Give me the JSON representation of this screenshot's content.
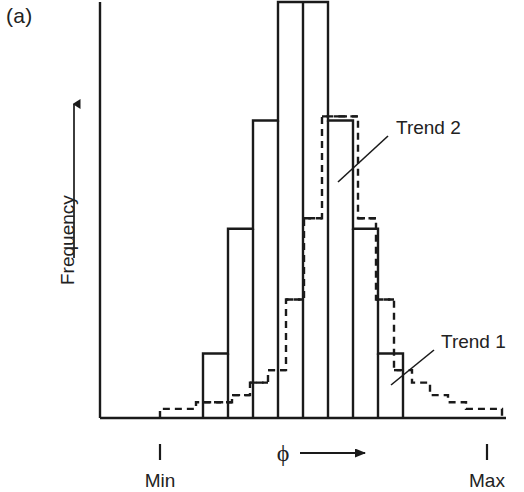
{
  "figure": {
    "panel_label": "(a)",
    "width": 524,
    "height": 492,
    "line_color": "#1a1a1a",
    "background": "#ffffff"
  },
  "axes": {
    "y_title": "Frequency",
    "y_arrow": "up-arrow",
    "x_symbol": "ϕ",
    "x_arrow": "right-arrow",
    "x_tick_min_label": "Min",
    "x_tick_max_label": "Max"
  },
  "annotations": [
    {
      "label": "Trend 2",
      "target": "solid-histogram"
    },
    {
      "label": "Trend 1",
      "target": "dashed-histogram"
    }
  ],
  "chart_data": {
    "type": "bar",
    "title": "",
    "subtitle": "",
    "xlabel": "ϕ",
    "ylabel": "Frequency",
    "grid": false,
    "legend_position": "inline-annotations",
    "xlim": [
      0,
      1
    ],
    "ylim": [
      0,
      1
    ],
    "x_tick_labels": [
      "Min",
      "Max"
    ],
    "x_tick_positions": [
      0.15,
      0.96
    ],
    "series": [
      {
        "name": "Trend 2",
        "style": "solid",
        "bin_left_px": [
          203,
          228,
          253,
          278,
          303,
          328,
          353,
          378
        ],
        "bin_width_px": 25,
        "values": [
          0.155,
          0.455,
          0.715,
          1.0,
          1.0,
          0.715,
          0.455,
          0.155
        ]
      },
      {
        "name": "Trend 1",
        "style": "dashed",
        "bin_left_px": [
          160,
          178,
          196,
          214,
          232,
          250,
          268,
          286,
          304,
          322,
          340,
          358,
          376,
          394,
          412,
          430,
          448,
          466,
          484
        ],
        "bin_width_px": 18,
        "values": [
          0.022,
          0.022,
          0.038,
          0.038,
          0.055,
          0.085,
          0.115,
          0.285,
          0.48,
          0.725,
          0.725,
          0.48,
          0.285,
          0.115,
          0.085,
          0.055,
          0.038,
          0.022,
          0.022
        ]
      }
    ]
  }
}
